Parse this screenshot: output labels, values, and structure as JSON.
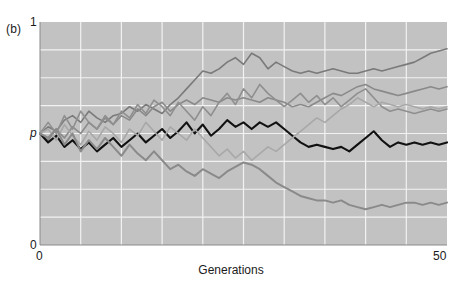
{
  "figure": {
    "panel_label": "(b)",
    "background_color": "#ffffff"
  },
  "axes": {
    "plot_background_color": "#c2c2c2",
    "gridline_color": "#f2f2f2",
    "axis_line_color": "#8a8a8a",
    "y_axis": {
      "label_top": "1",
      "label_mid": "p",
      "label_bottom": "0",
      "min": 0,
      "max": 1,
      "gridline_values": [
        0.125,
        0.25,
        0.375,
        0.5,
        0.625,
        0.75,
        0.875
      ]
    },
    "x_axis": {
      "title": "Generations",
      "label_left": "0",
      "label_right": "50",
      "min": 0,
      "max": 50,
      "gridline_values": [
        5,
        10,
        15,
        20,
        25,
        30,
        35,
        40,
        45
      ]
    }
  },
  "chart_data": {
    "type": "line",
    "title": "",
    "subtitle": "",
    "xlabel": "Generations",
    "ylabel": "p",
    "xlim": [
      0,
      50
    ],
    "ylim": [
      0,
      1
    ],
    "grid": true,
    "legend": "none",
    "annotations": [
      "(b)"
    ],
    "x": [
      0,
      1,
      2,
      3,
      4,
      5,
      6,
      7,
      8,
      9,
      10,
      11,
      12,
      13,
      14,
      15,
      16,
      17,
      18,
      19,
      20,
      21,
      22,
      23,
      24,
      25,
      26,
      27,
      28,
      29,
      30,
      31,
      32,
      33,
      34,
      35,
      36,
      37,
      38,
      39,
      40,
      41,
      42,
      43,
      44,
      45,
      46,
      47,
      48,
      49,
      50
    ],
    "series": [
      {
        "name": "line-1-rising",
        "color": "#7a7a7a",
        "width": 1.6,
        "values": [
          0.5,
          0.53,
          0.51,
          0.56,
          0.58,
          0.55,
          0.6,
          0.57,
          0.55,
          0.58,
          0.59,
          0.62,
          0.6,
          0.63,
          0.61,
          0.59,
          0.63,
          0.66,
          0.7,
          0.74,
          0.78,
          0.77,
          0.79,
          0.82,
          0.84,
          0.81,
          0.86,
          0.84,
          0.79,
          0.82,
          0.8,
          0.78,
          0.77,
          0.78,
          0.77,
          0.78,
          0.79,
          0.78,
          0.77,
          0.77,
          0.78,
          0.79,
          0.78,
          0.79,
          0.8,
          0.81,
          0.82,
          0.84,
          0.86,
          0.87,
          0.88
        ]
      },
      {
        "name": "line-2-midhigh",
        "color": "#8a8a8a",
        "width": 1.6,
        "values": [
          0.5,
          0.47,
          0.52,
          0.48,
          0.53,
          0.5,
          0.55,
          0.52,
          0.57,
          0.54,
          0.58,
          0.56,
          0.61,
          0.58,
          0.62,
          0.64,
          0.6,
          0.63,
          0.65,
          0.63,
          0.66,
          0.65,
          0.64,
          0.66,
          0.65,
          0.66,
          0.65,
          0.64,
          0.66,
          0.65,
          0.64,
          0.62,
          0.63,
          0.62,
          0.64,
          0.66,
          0.68,
          0.67,
          0.69,
          0.71,
          0.72,
          0.7,
          0.69,
          0.68,
          0.67,
          0.68,
          0.69,
          0.7,
          0.71,
          0.7,
          0.71
        ]
      },
      {
        "name": "line-3-spiky-mid",
        "color": "#8f8f8f",
        "width": 1.6,
        "values": [
          0.5,
          0.55,
          0.5,
          0.58,
          0.52,
          0.6,
          0.55,
          0.52,
          0.58,
          0.54,
          0.6,
          0.57,
          0.63,
          0.59,
          0.65,
          0.62,
          0.58,
          0.64,
          0.6,
          0.56,
          0.62,
          0.58,
          0.64,
          0.68,
          0.63,
          0.7,
          0.66,
          0.72,
          0.68,
          0.65,
          0.62,
          0.65,
          0.68,
          0.64,
          0.67,
          0.63,
          0.66,
          0.62,
          0.65,
          0.68,
          0.7,
          0.66,
          0.62,
          0.6,
          0.61,
          0.6,
          0.59,
          0.6,
          0.61,
          0.6,
          0.61
        ]
      },
      {
        "name": "line-4-black",
        "color": "#111111",
        "width": 2.1,
        "values": [
          0.5,
          0.46,
          0.49,
          0.44,
          0.47,
          0.43,
          0.46,
          0.42,
          0.45,
          0.48,
          0.44,
          0.47,
          0.5,
          0.46,
          0.49,
          0.52,
          0.48,
          0.51,
          0.55,
          0.5,
          0.54,
          0.49,
          0.52,
          0.56,
          0.53,
          0.55,
          0.52,
          0.55,
          0.53,
          0.55,
          0.52,
          0.49,
          0.46,
          0.44,
          0.45,
          0.44,
          0.43,
          0.44,
          0.42,
          0.45,
          0.48,
          0.51,
          0.47,
          0.44,
          0.46,
          0.45,
          0.46,
          0.45,
          0.46,
          0.45,
          0.46
        ]
      },
      {
        "name": "line-5-pale-crossing",
        "color": "#a8a8a8",
        "width": 1.6,
        "values": [
          0.5,
          0.52,
          0.47,
          0.54,
          0.49,
          0.45,
          0.51,
          0.47,
          0.53,
          0.5,
          0.46,
          0.52,
          0.49,
          0.55,
          0.51,
          0.47,
          0.53,
          0.5,
          0.47,
          0.52,
          0.48,
          0.44,
          0.4,
          0.43,
          0.39,
          0.42,
          0.38,
          0.41,
          0.44,
          0.42,
          0.45,
          0.48,
          0.51,
          0.54,
          0.57,
          0.55,
          0.58,
          0.61,
          0.63,
          0.66,
          0.64,
          0.62,
          0.64,
          0.63,
          0.62,
          0.63,
          0.62,
          0.61,
          0.62,
          0.61,
          0.62
        ]
      },
      {
        "name": "line-6-declining",
        "color": "#8a8a8a",
        "width": 2.0,
        "values": [
          0.5,
          0.48,
          0.52,
          0.45,
          0.5,
          0.42,
          0.47,
          0.43,
          0.48,
          0.44,
          0.4,
          0.45,
          0.41,
          0.38,
          0.42,
          0.38,
          0.34,
          0.36,
          0.33,
          0.31,
          0.34,
          0.32,
          0.3,
          0.33,
          0.35,
          0.37,
          0.36,
          0.34,
          0.31,
          0.28,
          0.26,
          0.24,
          0.22,
          0.21,
          0.2,
          0.2,
          0.19,
          0.2,
          0.18,
          0.17,
          0.16,
          0.17,
          0.18,
          0.17,
          0.18,
          0.19,
          0.19,
          0.18,
          0.19,
          0.18,
          0.19
        ]
      }
    ]
  }
}
